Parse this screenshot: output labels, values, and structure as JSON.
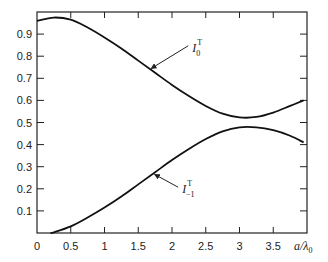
{
  "chart_data": {
    "type": "line",
    "title": "",
    "xlabel": "a/λ0",
    "ylabel": "",
    "xlim": [
      0,
      4
    ],
    "ylim": [
      0,
      1.0
    ],
    "grid": false,
    "legend": "none (inline annotations with arrows)",
    "x_ticks": [
      "0",
      "0.5",
      "1",
      "1.5",
      "2",
      "2.5",
      "3",
      "3.5"
    ],
    "y_ticks": [
      "0.1",
      "0.2",
      "0.3",
      "0.4",
      "0.5",
      "0.6",
      "0.7",
      "0.8",
      "0.9"
    ],
    "series": [
      {
        "name": "I_0^T",
        "label_main": "I",
        "label_sup": "T",
        "label_sub": "0",
        "x": [
          0,
          0.25,
          0.5,
          0.75,
          1.0,
          1.25,
          1.5,
          1.75,
          2.0,
          2.25,
          2.5,
          2.75,
          3.0,
          3.25,
          3.5,
          3.75,
          3.95
        ],
        "y": [
          0.96,
          0.975,
          0.965,
          0.93,
          0.885,
          0.835,
          0.78,
          0.725,
          0.67,
          0.62,
          0.575,
          0.54,
          0.523,
          0.525,
          0.545,
          0.575,
          0.6
        ]
      },
      {
        "name": "I_-1^T",
        "label_main": "I",
        "label_sup": "T",
        "label_sub": "−1",
        "x": [
          0.2,
          0.25,
          0.5,
          0.75,
          1.0,
          1.25,
          1.5,
          1.75,
          2.0,
          2.25,
          2.5,
          2.75,
          3.0,
          3.25,
          3.5,
          3.75,
          3.95
        ],
        "y": [
          0.0,
          0.003,
          0.03,
          0.07,
          0.115,
          0.165,
          0.22,
          0.275,
          0.33,
          0.38,
          0.425,
          0.46,
          0.478,
          0.478,
          0.465,
          0.44,
          0.41
        ]
      }
    ],
    "annotations": [
      {
        "text": "I_0^T",
        "arrow_to": [
          1.65,
          0.745
        ],
        "text_at": [
          2.3,
          0.82
        ]
      },
      {
        "text": "I_-1^T",
        "arrow_to": [
          1.7,
          0.265
        ],
        "text_at": [
          2.15,
          0.18
        ]
      }
    ]
  }
}
